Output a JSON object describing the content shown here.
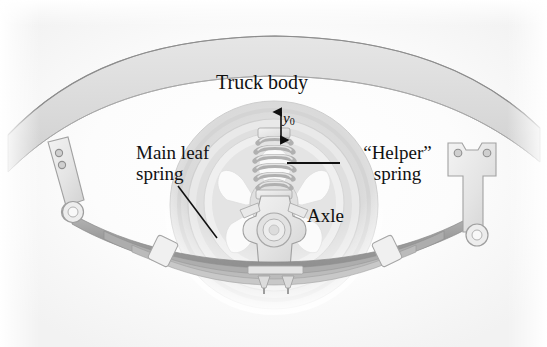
{
  "figure": {
    "background_color": "#ffffff",
    "width": 547,
    "height": 347
  },
  "labels": {
    "truck_body": "Truck body",
    "main_leaf_spring_line1": "Main leaf",
    "main_leaf_spring_line2": "spring",
    "helper_spring_line1": "“Helper”",
    "helper_spring_line2": "spring",
    "axle": "Axle",
    "y0_symbol": "y",
    "y0_subscript": "0"
  },
  "parts": {
    "truck_body": "truck-body-panel",
    "wheel": "wheel-tire",
    "rim": "wheel-rim",
    "hub": "axle-hub",
    "coil": "helper-coil-spring",
    "leaf_stack": "main-leaf-spring-stack",
    "left_shackle": "left-spring-shackle",
    "right_hanger": "right-spring-hanger",
    "u_bolts": "axle-u-bolts",
    "clamps": "leaf-spring-clamps"
  },
  "colors": {
    "body_fill": "#dcdcdc",
    "body_stroke": "#9a9a9a",
    "tire_outer": "#d9d9d9",
    "tire_mid": "#e2e2e2",
    "rim_fill": "#efefef",
    "spoke_fill": "#fbfbfb",
    "leaf_dark": "#9d9d9d",
    "leaf_light": "#cfcfcf",
    "metal_fill": "#e8e8e8",
    "metal_stroke": "#a3a3a3",
    "coil_fill": "#d2d2d2",
    "leader_line": "#101010",
    "text": "#111111"
  },
  "annotations": {
    "leader_main_leaf": {
      "from_x": 178,
      "from_y": 186,
      "to_x": 217,
      "to_y": 238
    },
    "leader_helper": {
      "from_x": 340,
      "from_y": 163,
      "to_x": 287,
      "to_y": 163
    },
    "dimension_y0": {
      "x": 281,
      "top_y": 108,
      "bottom_y": 142,
      "meaning": "static deflection y0"
    }
  }
}
